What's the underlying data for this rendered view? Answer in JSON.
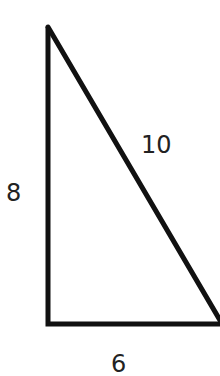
{
  "diagram": {
    "type": "right-triangle",
    "stroke_color": "#111111",
    "label_color": "#222222",
    "sides": {
      "hypotenuse": "10",
      "vertical_leg": "8",
      "horizontal_leg": "6"
    }
  }
}
